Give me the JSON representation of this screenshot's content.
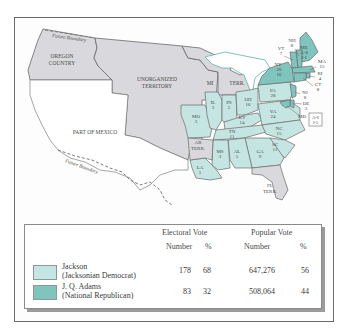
{
  "map": {
    "colors": {
      "jackson": "#c5e5e2",
      "adams": "#7fc4bd",
      "territory": "#d9d9dd",
      "border": "#6a6a6a",
      "coast": "#4aa8a0"
    },
    "region_labels": {
      "oregon_line1": "OREGON",
      "oregon_line2": "COUNTRY",
      "unorg_line1": "UNORGANIZED",
      "unorg_line2": "TERRITORY",
      "mexico": "PART OF MEXICO",
      "future_boundary_north": "Future Boundary",
      "future_boundary_south": "Future Boundary",
      "mi": "MI",
      "terr": "TERR.",
      "ar_line1": "AR",
      "ar_line2": "TERR.",
      "fl_line1": "FL",
      "fl_line2": "TERR."
    },
    "states": [
      {
        "abbr": "ME",
        "votes": "A-8 J-1",
        "party": "adams"
      },
      {
        "abbr": "NH",
        "votes": "8",
        "party": "adams"
      },
      {
        "abbr": "VT",
        "votes": "7",
        "party": "adams"
      },
      {
        "abbr": "MA",
        "votes": "15",
        "party": "adams"
      },
      {
        "abbr": "RI",
        "votes": "4",
        "party": "adams"
      },
      {
        "abbr": "CT",
        "votes": "8",
        "party": "adams"
      },
      {
        "abbr": "NY",
        "votes": "20 16",
        "party": "split"
      },
      {
        "abbr": "NJ",
        "votes": "8",
        "party": "adams"
      },
      {
        "abbr": "DE",
        "votes": "3",
        "party": "adams"
      },
      {
        "abbr": "MD",
        "votes": "A-6 J-5",
        "party": "split"
      },
      {
        "abbr": "PA",
        "votes": "28",
        "party": "jackson"
      },
      {
        "abbr": "OH",
        "votes": "16",
        "party": "jackson"
      },
      {
        "abbr": "IN",
        "votes": "5",
        "party": "jackson"
      },
      {
        "abbr": "IL",
        "votes": "3",
        "party": "jackson"
      },
      {
        "abbr": "MO",
        "votes": "3",
        "party": "jackson"
      },
      {
        "abbr": "KY",
        "votes": "14",
        "party": "jackson"
      },
      {
        "abbr": "VA",
        "votes": "24",
        "party": "jackson"
      },
      {
        "abbr": "NC",
        "votes": "15",
        "party": "jackson"
      },
      {
        "abbr": "TN",
        "votes": "11",
        "party": "jackson"
      },
      {
        "abbr": "SC",
        "votes": "11",
        "party": "jackson"
      },
      {
        "abbr": "GA",
        "votes": "9",
        "party": "jackson"
      },
      {
        "abbr": "AL",
        "votes": "5",
        "party": "jackson"
      },
      {
        "abbr": "MS",
        "votes": "3",
        "party": "jackson"
      },
      {
        "abbr": "LA",
        "votes": "5",
        "party": "jackson"
      }
    ],
    "md_box_line1": "A-6",
    "md_box_line2": "J-5",
    "me_line1": "A-8",
    "me_line2": "J-1",
    "ny_line1": "20",
    "ny_line2": "16"
  },
  "legend": {
    "headers": {
      "electoral": "Electoral Vote",
      "popular": "Popular Vote",
      "number1": "Number",
      "pct1": "%",
      "number2": "Number",
      "pct2": "%"
    },
    "rows": [
      {
        "name": "Jackson",
        "party": "(Jacksonian Democrat)",
        "electoral_number": "178",
        "electoral_pct": "68",
        "popular_number": "647,276",
        "popular_pct": "56",
        "color": "#c5e5e2"
      },
      {
        "name": "J. Q. Adams",
        "party": "(National Republican)",
        "electoral_number": "83",
        "electoral_pct": "32",
        "popular_number": "508,064",
        "popular_pct": "44",
        "color": "#7fc4bd"
      }
    ]
  }
}
